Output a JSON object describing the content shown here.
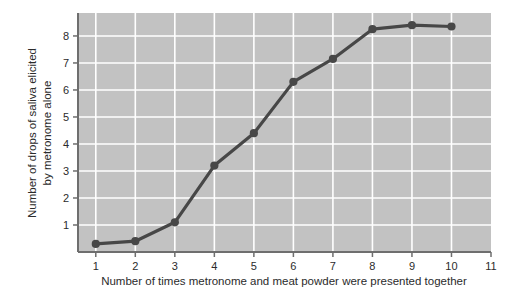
{
  "chart_data": {
    "type": "line",
    "title": "",
    "xlabel": "Number of times metronome and meat powder were presented together",
    "ylabel_line1": "Number of drops of saliva elicited",
    "ylabel_line2": "by metronome alone",
    "x": [
      1,
      2,
      3,
      4,
      5,
      6,
      7,
      8,
      9,
      10
    ],
    "values": [
      0.3,
      0.4,
      1.1,
      3.2,
      4.4,
      6.3,
      7.15,
      8.25,
      8.4,
      8.35
    ],
    "series": [
      {
        "name": "Drops of saliva",
        "values": [
          0.3,
          0.4,
          1.1,
          3.2,
          4.4,
          6.3,
          7.15,
          8.25,
          8.4,
          8.35
        ]
      }
    ],
    "xticks": [
      "1",
      "2",
      "3",
      "4",
      "5",
      "6",
      "7",
      "8",
      "9",
      "10",
      "11"
    ],
    "xtick_values": [
      1,
      2,
      3,
      4,
      5,
      6,
      7,
      8,
      9,
      10,
      11
    ],
    "yticks": [
      "1",
      "2",
      "3",
      "4",
      "5",
      "6",
      "7",
      "8"
    ],
    "ytick_values": [
      1,
      2,
      3,
      4,
      5,
      6,
      7,
      8
    ],
    "xlim": [
      0.55,
      11.0
    ],
    "ylim": [
      0.0,
      8.85
    ],
    "grid": true,
    "legend": "none",
    "plot_background_color": "#c2c2c2",
    "grid_color": "#ffffff",
    "line_color": "#474747",
    "marker_color": "#474747",
    "axis_color": "#6e6e6e",
    "figure_background_color": "#ffffff",
    "text_color": "#2b2b2b"
  }
}
